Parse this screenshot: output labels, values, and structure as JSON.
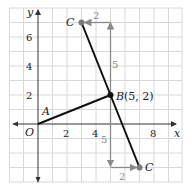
{
  "diagram": {
    "title": "",
    "axes": {
      "x_label": "x",
      "y_label": "y",
      "origin_label": "O",
      "x_ticks": [
        {
          "value": 2,
          "label": "2"
        },
        {
          "value": 4,
          "label": "4"
        },
        {
          "value": 8,
          "label": "8"
        }
      ],
      "y_ticks": [
        {
          "value": 2,
          "label": "2"
        },
        {
          "value": 4,
          "label": "4"
        },
        {
          "value": 6,
          "label": "6"
        }
      ],
      "x_range": [
        -2,
        10
      ],
      "y_range": [
        -4,
        8
      ]
    },
    "points": {
      "A": {
        "label": "A",
        "x": 0,
        "y": 0
      },
      "B": {
        "label": "B",
        "coord_label": "(5, 2)",
        "x": 5,
        "y": 2
      },
      "C_upper": {
        "label": "C",
        "x": 3,
        "y": 7
      },
      "C_lower": {
        "label": "C",
        "x": 7,
        "y": -3
      }
    },
    "segments": [
      {
        "from": "A",
        "to": "B"
      },
      {
        "from": "C_upper",
        "to": "C_lower"
      }
    ],
    "arrows": {
      "up_rise": "5",
      "up_run": "2",
      "down_rise": "5",
      "down_run": "2"
    },
    "colors": {
      "grid": "#d8d8d8",
      "axis": "#333333",
      "segment": "#111111",
      "arrow": "#8a8a8a",
      "point_gray": "#7a7a7a"
    }
  }
}
